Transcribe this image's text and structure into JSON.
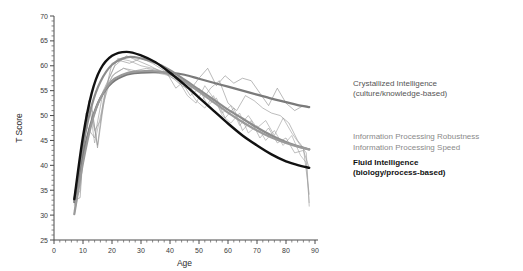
{
  "chart_data": {
    "type": "line",
    "title": "",
    "xlabel": "Age",
    "ylabel": "T Score",
    "xlim": [
      0,
      90
    ],
    "ylim": [
      25,
      70
    ],
    "xticks": [
      0,
      10,
      20,
      30,
      40,
      50,
      60,
      70,
      80,
      90
    ],
    "yticks": [
      25,
      30,
      35,
      40,
      45,
      50,
      55,
      60,
      65,
      70
    ],
    "xtick_labels": [
      "0",
      "10",
      "20",
      "30",
      "40",
      "50",
      "60",
      "70",
      "80",
      "90"
    ],
    "ytick_labels": [
      "25",
      "30",
      "35",
      "40",
      "45",
      "50",
      "55",
      "60",
      "65",
      "70"
    ],
    "grid": false,
    "legend_position": "right-inline",
    "minor_ticks_per_interval": 5,
    "series": [
      {
        "name": "Crystallized Intelligence",
        "sublabel": "(culture/knowledge-based)",
        "color": "#7a7a7a",
        "width": 2.2,
        "x": [
          7,
          10,
          13,
          16,
          20,
          25,
          30,
          35,
          40,
          45,
          50,
          55,
          60,
          65,
          70,
          75,
          80,
          85,
          88
        ],
        "y": [
          32.6,
          42.0,
          49.0,
          53.5,
          56.6,
          58.2,
          58.6,
          58.7,
          58.6,
          58.2,
          57.4,
          56.6,
          55.8,
          55.0,
          54.2,
          53.4,
          52.7,
          52.0,
          51.7
        ]
      },
      {
        "name": "Information Processing Robustness",
        "sublabel": "",
        "color": "#8c8c8c",
        "width": 2.2,
        "x": [
          7,
          10,
          13,
          16,
          20,
          25,
          30,
          35,
          40,
          45,
          50,
          55,
          60,
          65,
          70,
          75,
          80,
          85,
          88
        ],
        "y": [
          32.9,
          44.0,
          52.0,
          56.8,
          60.2,
          61.7,
          61.5,
          60.6,
          59.1,
          57.2,
          55.2,
          53.2,
          51.2,
          49.4,
          47.6,
          46.0,
          44.7,
          43.7,
          43.2
        ]
      },
      {
        "name": "Information Processing Speed",
        "sublabel": "",
        "color": "#9a9a9a",
        "width": 2.2,
        "x": [
          7,
          10,
          13,
          16,
          20,
          25,
          30,
          35,
          40,
          45,
          50,
          55,
          60,
          65,
          70,
          75,
          80,
          85,
          88
        ],
        "y": [
          30.2,
          40.5,
          48.5,
          53.5,
          57.0,
          58.5,
          58.9,
          58.9,
          58.3,
          56.8,
          54.8,
          52.7,
          50.6,
          48.7,
          47.0,
          45.6,
          44.5,
          43.6,
          43.2
        ]
      },
      {
        "name": "Fluid Intelligence",
        "sublabel": "(biology/process-based)",
        "color": "#111111",
        "width": 2.4,
        "x": [
          7,
          10,
          13,
          16,
          20,
          25,
          30,
          35,
          40,
          45,
          50,
          55,
          60,
          65,
          70,
          75,
          80,
          85,
          88
        ],
        "y": [
          33.2,
          45.8,
          54.5,
          59.3,
          62.0,
          62.8,
          62.1,
          60.7,
          58.6,
          56.2,
          53.6,
          51.0,
          48.4,
          46.0,
          44.0,
          42.2,
          40.8,
          39.9,
          39.5
        ]
      }
    ],
    "raw_series": [
      {
        "name": "raw-1",
        "color": "#8a8a8a",
        "x": [
          7,
          9,
          11,
          13,
          15,
          17,
          20,
          23,
          26,
          30,
          34,
          38,
          41,
          44,
          47,
          50,
          53,
          56,
          59,
          62,
          65,
          68,
          71,
          74,
          77,
          80,
          83,
          86,
          88
        ],
        "y": [
          33.0,
          33.5,
          50.5,
          51.0,
          44.0,
          53.0,
          60.5,
          61.0,
          60.5,
          61.5,
          60.5,
          59.0,
          58.0,
          56.0,
          55.2,
          57.5,
          59.5,
          56.0,
          58.0,
          56.5,
          57.5,
          57.0,
          54.5,
          52.0,
          55.5,
          52.5,
          51.0,
          52.0,
          51.8
        ]
      },
      {
        "name": "raw-2",
        "color": "#909090",
        "x": [
          7,
          9,
          11,
          13,
          15,
          18,
          21,
          24,
          28,
          32,
          36,
          39,
          42,
          45,
          48,
          51,
          54,
          57,
          60,
          63,
          66,
          69,
          72,
          75,
          78,
          81,
          84,
          86,
          88
        ],
        "y": [
          30.2,
          36.5,
          49.5,
          52.0,
          43.5,
          56.0,
          58.5,
          59.5,
          59.0,
          59.5,
          59.0,
          58.5,
          55.5,
          57.0,
          55.0,
          53.0,
          55.5,
          57.0,
          52.5,
          51.0,
          54.0,
          53.0,
          51.5,
          50.5,
          50.0,
          48.5,
          45.0,
          43.5,
          34.2
        ]
      },
      {
        "name": "raw-3",
        "color": "#9a9a9a",
        "x": [
          7,
          9,
          12,
          14,
          16,
          19,
          22,
          26,
          30,
          34,
          37,
          40,
          43,
          46,
          49,
          52,
          55,
          58,
          61,
          64,
          67,
          70,
          73,
          76,
          79,
          82,
          85,
          87,
          88
        ],
        "y": [
          32.0,
          38.0,
          52.0,
          47.0,
          49.0,
          57.5,
          61.5,
          61.0,
          60.0,
          59.5,
          59.0,
          58.3,
          57.0,
          54.0,
          52.5,
          56.0,
          53.5,
          50.5,
          52.0,
          48.0,
          50.0,
          47.5,
          49.0,
          46.0,
          49.5,
          46.5,
          44.0,
          42.5,
          31.8
        ]
      },
      {
        "name": "raw-4",
        "color": "#a0a0a0",
        "x": [
          7,
          10,
          12,
          14,
          17,
          20,
          24,
          28,
          32,
          36,
          40,
          43,
          46,
          49,
          52,
          55,
          58,
          61,
          64,
          67,
          70,
          73,
          76,
          79,
          82,
          85,
          87,
          88
        ],
        "y": [
          31.0,
          41.0,
          53.0,
          44.5,
          52.5,
          58.0,
          59.5,
          58.5,
          58.8,
          58.5,
          58.0,
          56.5,
          55.8,
          53.0,
          51.5,
          54.0,
          50.0,
          48.5,
          50.5,
          46.5,
          48.0,
          45.0,
          47.0,
          44.0,
          46.0,
          42.0,
          40.5,
          32.5
        ]
      },
      {
        "name": "raw-5",
        "color": "#949494",
        "x": [
          7,
          9,
          11,
          14,
          17,
          21,
          25,
          29,
          33,
          37,
          41,
          44,
          47,
          50,
          53,
          56,
          59,
          62,
          65,
          68,
          71,
          74,
          77,
          80,
          83,
          86,
          88
        ],
        "y": [
          32.5,
          35.0,
          48.0,
          45.5,
          55.0,
          60.0,
          62.0,
          61.0,
          60.0,
          58.8,
          57.5,
          56.8,
          54.0,
          55.5,
          52.0,
          53.5,
          49.5,
          51.5,
          47.0,
          49.0,
          45.5,
          47.5,
          44.5,
          45.5,
          42.5,
          43.0,
          39.5
        ]
      }
    ],
    "annotations": [
      {
        "id": "crystallized",
        "lines": [
          "Crystallized Intelligence",
          "(culture/knowledge-based)"
        ],
        "color": "#555555",
        "bold": false,
        "x": 353,
        "y": 86
      },
      {
        "id": "ip-robustness",
        "lines": [
          "Information Processing Robustness"
        ],
        "color": "#8a8a8a",
        "bold": false,
        "x": 353,
        "y": 139
      },
      {
        "id": "ip-speed",
        "lines": [
          "Information Processing Speed"
        ],
        "color": "#8a8a8a",
        "bold": false,
        "x": 353,
        "y": 150
      },
      {
        "id": "fluid",
        "lines": [
          "Fluid Intelligence",
          "(biology/process-based)"
        ],
        "color": "#111111",
        "bold": true,
        "x": 353,
        "y": 165
      }
    ]
  }
}
